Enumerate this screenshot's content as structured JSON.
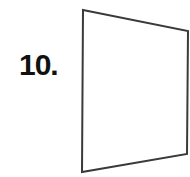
{
  "problem": {
    "number_label": "10."
  },
  "figure": {
    "type": "quadrilateral",
    "stroke_color": "#3a3a3a",
    "fill_color": "#ffffff",
    "stroke_width": 2,
    "points": "83,10 188,31 187,154 82,172"
  }
}
